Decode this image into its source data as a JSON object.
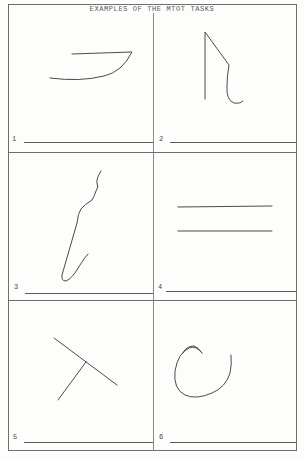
{
  "document": {
    "title": "EXAMPLES OF THE MTOT TASKS",
    "layout": {
      "rows": 3,
      "columns": 2
    },
    "panels": [
      {
        "number": "1",
        "figure": "hook-stroke",
        "description": "horizontal line joined to a curved underline stroke"
      },
      {
        "number": "2",
        "figure": "angled-hook",
        "description": "vertical line, diagonal down-right, then downward hook"
      },
      {
        "number": "3",
        "figure": "wavy-j-curve",
        "description": "wavy line descending diagonally into a J-shaped hook"
      },
      {
        "number": "4",
        "figure": "parallel-lines",
        "description": "two parallel horizontal lines"
      },
      {
        "number": "5",
        "figure": "t-shape",
        "description": "diagonal line with a perpendicular line branching from its middle"
      },
      {
        "number": "6",
        "figure": "open-circle",
        "description": "open spiral / incomplete circle"
      }
    ]
  },
  "colors": {
    "ink": "#4a4a4a",
    "frame": "#6e6e6e",
    "paper": "#fdfdfc"
  }
}
